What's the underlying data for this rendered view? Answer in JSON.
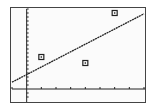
{
  "chart_data": {
    "type": "scatter",
    "title": "",
    "xlabel": "",
    "ylabel": "",
    "xlim": [
      -1,
      8
    ],
    "ylim": [
      -2,
      20
    ],
    "x_tick_step": 1,
    "y_tick_step": 1,
    "grid": false,
    "legend": "none",
    "series": [
      {
        "name": "data points",
        "type": "scatter",
        "marker": "square",
        "x": [
          1,
          4,
          6
        ],
        "y": [
          8,
          6.5,
          19
        ]
      },
      {
        "name": "regression line",
        "type": "line",
        "x": [
          -1,
          8
        ],
        "y": [
          1.7,
          18.8
        ]
      }
    ]
  },
  "colors": {
    "foreground": "#222222",
    "background": "#fbfbfb",
    "frame": "#444444"
  }
}
